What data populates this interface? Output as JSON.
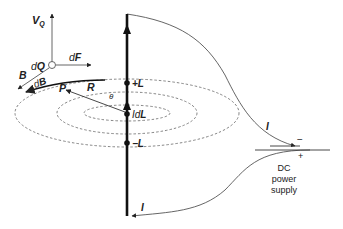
{
  "labels": {
    "vq_main": "V",
    "vq_sub": "Q",
    "dq_d": "d",
    "dq_q": "Q",
    "df_d": "d",
    "df_f": "F",
    "b": "B",
    "db_d": "d",
    "db_b": "B",
    "p": "P",
    "r": "R",
    "theta": "θ",
    "plus_l": "+L",
    "idl_i": "I",
    "idl_d": "d",
    "idl_l": "L",
    "minus_l": "−L",
    "current_top": "I",
    "current_bottom": "I",
    "minus_terminal": "−",
    "plus_terminal": "+",
    "supply_line1": "DC",
    "supply_line2": "power",
    "supply_line3": "supply"
  },
  "colors": {
    "wire": "#111111",
    "thin": "#555555",
    "dashed": "#666666",
    "text": "#222222"
  }
}
